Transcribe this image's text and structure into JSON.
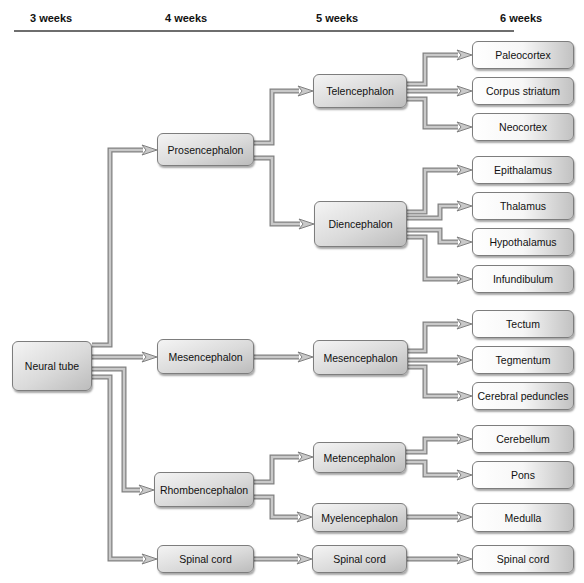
{
  "header": {
    "columns": [
      "3 weeks",
      "4 weeks",
      "5 weeks",
      "6 weeks"
    ],
    "column_x": [
      30,
      165,
      316,
      500
    ]
  },
  "nodes": [
    {
      "id": "neural_tube",
      "label": "Neural tube",
      "level": 0,
      "x": 12,
      "y": 341,
      "w": 80,
      "h": 50
    },
    {
      "id": "prosencephalon",
      "label": "Prosencephalon",
      "level": 1,
      "x": 157,
      "y": 133,
      "w": 97,
      "h": 33
    },
    {
      "id": "mesencephalon_4",
      "label": "Mesencephalon",
      "level": 1,
      "x": 157,
      "y": 339,
      "w": 97,
      "h": 35
    },
    {
      "id": "rhombencephalon",
      "label": "Rhombencephalon",
      "level": 1,
      "x": 154,
      "y": 472,
      "w": 100,
      "h": 35
    },
    {
      "id": "spinal_cord_4",
      "label": "Spinal cord",
      "level": 1,
      "x": 157,
      "y": 545,
      "w": 97,
      "h": 28
    },
    {
      "id": "telencephalon",
      "label": "Telencephalon",
      "level": 2,
      "x": 313,
      "y": 74,
      "w": 94,
      "h": 34
    },
    {
      "id": "diencephalon",
      "label": "Diencephalon",
      "level": 2,
      "x": 314,
      "y": 201,
      "w": 93,
      "h": 46
    },
    {
      "id": "mesencephalon_5",
      "label": "Mesencephalon",
      "level": 2,
      "x": 313,
      "y": 340,
      "w": 95,
      "h": 35
    },
    {
      "id": "metencephalon",
      "label": "Metencephalon",
      "level": 2,
      "x": 313,
      "y": 442,
      "w": 93,
      "h": 31
    },
    {
      "id": "myelencephalon",
      "label": "Myelencephalon",
      "level": 2,
      "x": 312,
      "y": 503,
      "w": 95,
      "h": 29
    },
    {
      "id": "spinal_cord_5",
      "label": "Spinal cord",
      "level": 2,
      "x": 312,
      "y": 545,
      "w": 95,
      "h": 28
    },
    {
      "id": "paleocortex",
      "label": "Paleocortex",
      "level": 3,
      "x": 472,
      "y": 41,
      "w": 102,
      "h": 28
    },
    {
      "id": "corpus_striatum",
      "label": "Corpus striatum",
      "level": 3,
      "x": 472,
      "y": 77,
      "w": 102,
      "h": 28
    },
    {
      "id": "neocortex",
      "label": "Neocortex",
      "level": 3,
      "x": 472,
      "y": 113,
      "w": 102,
      "h": 28
    },
    {
      "id": "epithalamus",
      "label": "Epithalamus",
      "level": 3,
      "x": 472,
      "y": 156,
      "w": 102,
      "h": 28
    },
    {
      "id": "thalamus",
      "label": "Thalamus",
      "level": 3,
      "x": 472,
      "y": 192,
      "w": 102,
      "h": 28
    },
    {
      "id": "hypothalamus",
      "label": "Hypothalamus",
      "level": 3,
      "x": 472,
      "y": 228,
      "w": 102,
      "h": 28
    },
    {
      "id": "infundibulum",
      "label": "Infundibulum",
      "level": 3,
      "x": 472,
      "y": 265,
      "w": 102,
      "h": 28
    },
    {
      "id": "tectum",
      "label": "Tectum",
      "level": 3,
      "x": 472,
      "y": 310,
      "w": 102,
      "h": 28
    },
    {
      "id": "tegmentum",
      "label": "Tegmentum",
      "level": 3,
      "x": 472,
      "y": 346,
      "w": 102,
      "h": 28
    },
    {
      "id": "cerebral_peduncles",
      "label": "Cerebral peduncles",
      "level": 3,
      "x": 472,
      "y": 382,
      "w": 102,
      "h": 28
    },
    {
      "id": "cerebellum",
      "label": "Cerebellum",
      "level": 3,
      "x": 472,
      "y": 425,
      "w": 102,
      "h": 28
    },
    {
      "id": "pons",
      "label": "Pons",
      "level": 3,
      "x": 472,
      "y": 461,
      "w": 102,
      "h": 28
    },
    {
      "id": "medulla",
      "label": "Medulla",
      "level": 3,
      "x": 472,
      "y": 503,
      "w": 102,
      "h": 29
    },
    {
      "id": "spinal_cord_6",
      "label": "Spinal cord",
      "level": 3,
      "x": 472,
      "y": 545,
      "w": 102,
      "h": 28
    }
  ],
  "edges": [
    {
      "from": "neural_tube",
      "to": "prosencephalon",
      "points": [
        [
          92,
          345
        ],
        [
          110,
          345
        ],
        [
          110,
          150
        ],
        [
          157,
          150
        ]
      ]
    },
    {
      "from": "neural_tube",
      "to": "mesencephalon_4",
      "points": [
        [
          92,
          357
        ],
        [
          157,
          357
        ]
      ]
    },
    {
      "from": "neural_tube",
      "to": "rhombencephalon",
      "points": [
        [
          92,
          369
        ],
        [
          124,
          369
        ],
        [
          124,
          490
        ],
        [
          154,
          490
        ]
      ]
    },
    {
      "from": "neural_tube",
      "to": "spinal_cord_4",
      "points": [
        [
          92,
          377
        ],
        [
          110,
          377
        ],
        [
          110,
          559
        ],
        [
          157,
          559
        ]
      ]
    },
    {
      "from": "prosencephalon",
      "to": "telencephalon",
      "points": [
        [
          254,
          143
        ],
        [
          272,
          143
        ],
        [
          272,
          91
        ],
        [
          313,
          91
        ]
      ]
    },
    {
      "from": "prosencephalon",
      "to": "diencephalon",
      "points": [
        [
          254,
          158
        ],
        [
          272,
          158
        ],
        [
          272,
          224
        ],
        [
          314,
          224
        ]
      ]
    },
    {
      "from": "mesencephalon_4",
      "to": "mesencephalon_5",
      "points": [
        [
          254,
          357
        ],
        [
          313,
          357
        ]
      ]
    },
    {
      "from": "rhombencephalon",
      "to": "metencephalon",
      "points": [
        [
          254,
          482
        ],
        [
          272,
          482
        ],
        [
          272,
          457
        ],
        [
          313,
          457
        ]
      ]
    },
    {
      "from": "rhombencephalon",
      "to": "myelencephalon",
      "points": [
        [
          254,
          497
        ],
        [
          272,
          497
        ],
        [
          272,
          517
        ],
        [
          312,
          517
        ]
      ]
    },
    {
      "from": "spinal_cord_4",
      "to": "spinal_cord_5",
      "points": [
        [
          254,
          559
        ],
        [
          312,
          559
        ]
      ]
    },
    {
      "from": "telencephalon",
      "to": "paleocortex",
      "points": [
        [
          407,
          84
        ],
        [
          425,
          84
        ],
        [
          425,
          55
        ],
        [
          472,
          55
        ]
      ]
    },
    {
      "from": "telencephalon",
      "to": "corpus_striatum",
      "points": [
        [
          407,
          91
        ],
        [
          472,
          91
        ]
      ]
    },
    {
      "from": "telencephalon",
      "to": "neocortex",
      "points": [
        [
          407,
          99
        ],
        [
          425,
          99
        ],
        [
          425,
          127
        ],
        [
          472,
          127
        ]
      ]
    },
    {
      "from": "diencephalon",
      "to": "epithalamus",
      "points": [
        [
          407,
          212
        ],
        [
          425,
          212
        ],
        [
          425,
          170
        ],
        [
          472,
          170
        ]
      ]
    },
    {
      "from": "diencephalon",
      "to": "thalamus",
      "points": [
        [
          407,
          218
        ],
        [
          440,
          218
        ],
        [
          440,
          206
        ],
        [
          472,
          206
        ]
      ]
    },
    {
      "from": "diencephalon",
      "to": "hypothalamus",
      "points": [
        [
          407,
          230
        ],
        [
          440,
          230
        ],
        [
          440,
          242
        ],
        [
          472,
          242
        ]
      ]
    },
    {
      "from": "diencephalon",
      "to": "infundibulum",
      "points": [
        [
          407,
          237
        ],
        [
          425,
          237
        ],
        [
          425,
          279
        ],
        [
          472,
          279
        ]
      ]
    },
    {
      "from": "mesencephalon_5",
      "to": "tectum",
      "points": [
        [
          408,
          351
        ],
        [
          425,
          351
        ],
        [
          425,
          324
        ],
        [
          472,
          324
        ]
      ]
    },
    {
      "from": "mesencephalon_5",
      "to": "tegmentum",
      "points": [
        [
          408,
          360
        ],
        [
          472,
          360
        ]
      ]
    },
    {
      "from": "mesencephalon_5",
      "to": "cerebral_peduncles",
      "points": [
        [
          408,
          367
        ],
        [
          425,
          367
        ],
        [
          425,
          396
        ],
        [
          472,
          396
        ]
      ]
    },
    {
      "from": "metencephalon",
      "to": "cerebellum",
      "points": [
        [
          406,
          452
        ],
        [
          425,
          452
        ],
        [
          425,
          439
        ],
        [
          472,
          439
        ]
      ]
    },
    {
      "from": "metencephalon",
      "to": "pons",
      "points": [
        [
          406,
          462
        ],
        [
          425,
          462
        ],
        [
          425,
          475
        ],
        [
          472,
          475
        ]
      ]
    },
    {
      "from": "myelencephalon",
      "to": "medulla",
      "points": [
        [
          407,
          517
        ],
        [
          472,
          517
        ]
      ]
    },
    {
      "from": "spinal_cord_5",
      "to": "spinal_cord_6",
      "points": [
        [
          407,
          559
        ],
        [
          472,
          559
        ]
      ]
    }
  ],
  "colors": {
    "arrow_fill": "#c9c9c9",
    "arrow_stroke": "#808080",
    "node_border": "#7d7d7d",
    "rule": "#6e6e6e",
    "text": "#111111"
  }
}
